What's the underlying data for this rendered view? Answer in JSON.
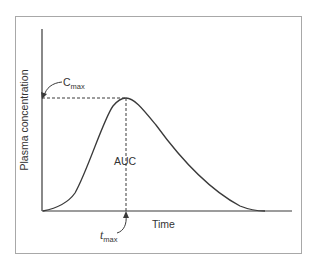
{
  "diagram": {
    "type": "pharmacokinetic-concentration-time-curve",
    "y_axis_label": "Plasma concentration",
    "x_axis_label": "Time",
    "annotations": {
      "cmax": {
        "symbol": "C",
        "subscript": "max"
      },
      "tmax": {
        "symbol": "t",
        "subscript": "max"
      },
      "auc": "AUC"
    },
    "colors": {
      "line": "#3a3a3a",
      "frame": "#a8a8a8",
      "text": "#333333"
    }
  }
}
